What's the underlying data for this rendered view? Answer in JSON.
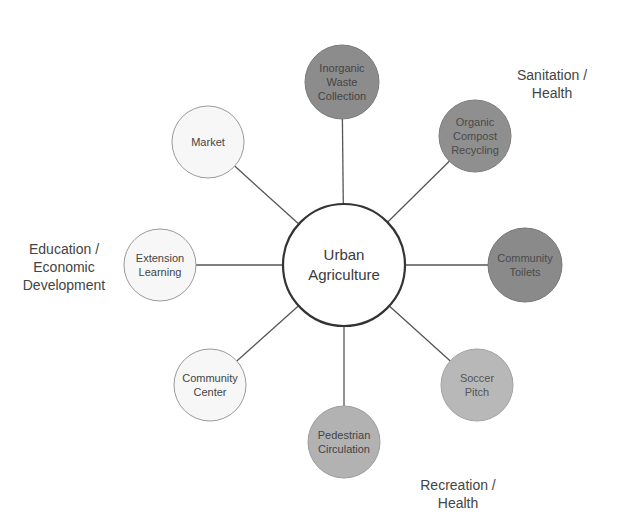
{
  "diagram": {
    "title": "",
    "center": {
      "id": "urban-agriculture",
      "label": "Urban\nAgriculture",
      "cx": 344,
      "cy": 265,
      "r": 61,
      "fill": "#ffffff",
      "stroke": "#333333",
      "text_color": "#3a3a3a"
    },
    "nodes": [
      {
        "id": "inorganic-waste-collection",
        "label": "Inorganic\nWaste\nCollection",
        "group": "sanitation-health",
        "cx": 342,
        "cy": 82,
        "r": 37,
        "fill": "#8c8c8c",
        "stroke": "#7a7a7a",
        "text_color": "#444444"
      },
      {
        "id": "organic-compost-recycling",
        "label": "Organic\nCompost\nRecycling",
        "group": "sanitation-health",
        "cx": 475,
        "cy": 136,
        "r": 36,
        "fill": "#8f8f8f",
        "stroke": "#7d7d7d",
        "text_color": "#4a4a4a"
      },
      {
        "id": "community-toilets",
        "label": "Community\nToilets",
        "group": "sanitation-health",
        "cx": 525,
        "cy": 265,
        "r": 37,
        "fill": "#8a8a8a",
        "stroke": "#777777",
        "text_color": "#4a4a4a"
      },
      {
        "id": "soccer-pitch",
        "label": "Soccer\nPitch",
        "group": "recreation-health",
        "cx": 477,
        "cy": 385,
        "r": 36,
        "fill": "#b8b8b8",
        "stroke": "#a2a2a2",
        "text_color": "#555555"
      },
      {
        "id": "pedestrian-circulation",
        "label": "Pedestrian\nCirculation",
        "group": "recreation-health",
        "cx": 344,
        "cy": 442,
        "r": 36,
        "fill": "#b2b2b2",
        "stroke": "#9c9c9c",
        "text_color": "#444444"
      },
      {
        "id": "community-center",
        "label": "Community\nCenter",
        "group": "education-economic-development",
        "cx": 210,
        "cy": 385,
        "r": 36,
        "fill": "#f7f7f7",
        "stroke": "#9a9a9a",
        "text_color": "#444444"
      },
      {
        "id": "extension-learning",
        "label": "Extension\nLearning",
        "group": "education-economic-development",
        "cx": 160,
        "cy": 265,
        "r": 36,
        "fill": "#f7f7f7",
        "stroke": "#9a9a9a",
        "text_color": "#444444"
      },
      {
        "id": "market",
        "label": "Market",
        "group": "education-economic-development",
        "cx": 208,
        "cy": 142,
        "r": 36,
        "fill": "#f7f7f7",
        "stroke": "#9a9a9a",
        "text_color": "#444444"
      }
    ],
    "edges": [
      {
        "from": "urban-agriculture",
        "to": "inorganic-waste-collection"
      },
      {
        "from": "urban-agriculture",
        "to": "organic-compost-recycling"
      },
      {
        "from": "urban-agriculture",
        "to": "community-toilets"
      },
      {
        "from": "urban-agriculture",
        "to": "soccer-pitch"
      },
      {
        "from": "urban-agriculture",
        "to": "pedestrian-circulation"
      },
      {
        "from": "urban-agriculture",
        "to": "community-center"
      },
      {
        "from": "urban-agriculture",
        "to": "extension-learning"
      },
      {
        "from": "urban-agriculture",
        "to": "market"
      }
    ],
    "groups": [
      {
        "id": "sanitation-health",
        "label": "Sanitation /\nHealth",
        "x": 497,
        "y": 66,
        "w": 110
      },
      {
        "id": "recreation-health",
        "label": "Recreation /\nHealth",
        "x": 398,
        "y": 476,
        "w": 120
      },
      {
        "id": "education-economic-development",
        "label": "Education /\nEconomic\nDevelopment",
        "x": 8,
        "y": 240,
        "w": 112
      }
    ]
  }
}
